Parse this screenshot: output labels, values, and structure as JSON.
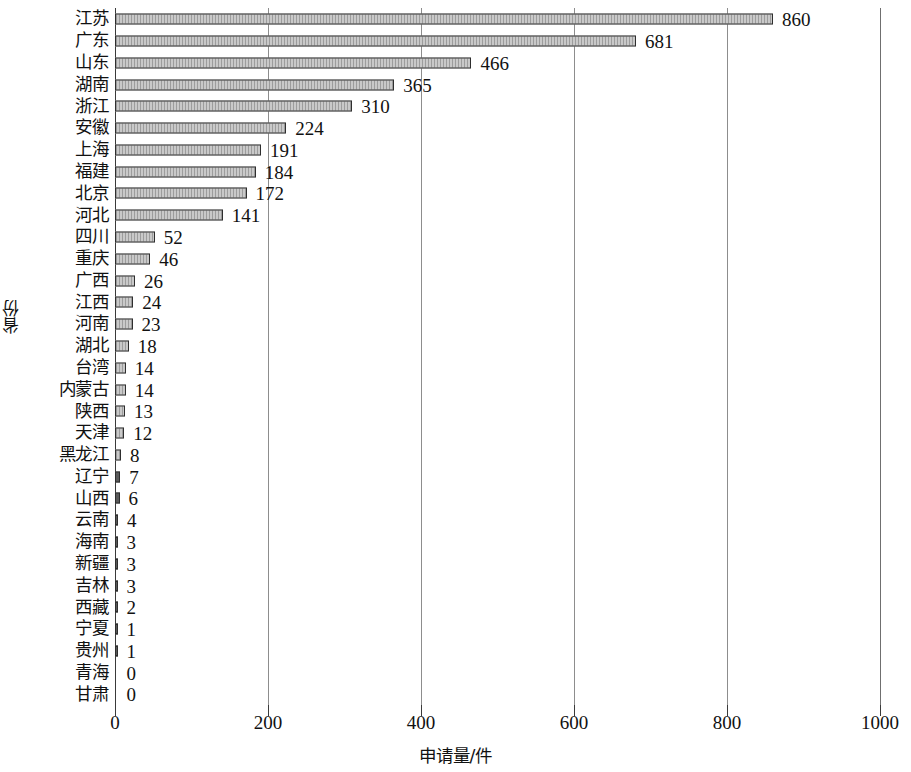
{
  "chart_data": {
    "type": "bar",
    "orientation": "horizontal",
    "title": "",
    "xlabel": "申请量/件",
    "ylabel": "省份",
    "xlim": [
      0,
      1000
    ],
    "xticks": [
      0,
      200,
      400,
      600,
      800,
      1000
    ],
    "grid": "vertical",
    "legend": "none",
    "data_labels": true,
    "categories": [
      "江苏",
      "广东",
      "山东",
      "湖南",
      "浙江",
      "安徽",
      "上海",
      "福建",
      "北京",
      "河北",
      "四川",
      "重庆",
      "广西",
      "江西",
      "河南",
      "湖北",
      "台湾",
      "内蒙古",
      "陕西",
      "天津",
      "黑龙江",
      "辽宁",
      "山西",
      "云南",
      "海南",
      "新疆",
      "吉林",
      "西藏",
      "宁夏",
      "贵州",
      "青海",
      "甘肃"
    ],
    "values": [
      860,
      681,
      466,
      365,
      310,
      224,
      191,
      184,
      172,
      141,
      52,
      46,
      26,
      24,
      23,
      18,
      14,
      14,
      13,
      12,
      8,
      7,
      6,
      4,
      3,
      3,
      3,
      2,
      1,
      1,
      0,
      0
    ],
    "colors": {
      "bar_fill": "#c9c9c9",
      "bar_edge": "#2e2e2e",
      "gridline": "#8d8d8d",
      "axis": "#3a3a3a",
      "text": "#111111",
      "background": "#ffffff"
    }
  }
}
